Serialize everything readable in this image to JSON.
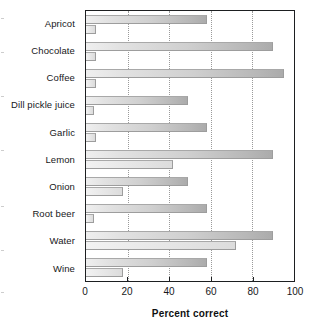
{
  "chart_data": {
    "type": "bar",
    "orientation": "horizontal",
    "title": "",
    "xlabel": "Percent correct",
    "ylabel": "",
    "xlim": [
      0,
      100
    ],
    "xticks": [
      0,
      20,
      40,
      60,
      80,
      100
    ],
    "xtick_labels": [
      "0",
      "20",
      "40",
      "60",
      "80",
      "100"
    ],
    "gridlines": {
      "vertical": [
        20,
        40,
        60,
        80
      ],
      "style": "dotted",
      "horizontal": []
    },
    "legend": {
      "visible": false,
      "entries": []
    },
    "categories": [
      "Apricot",
      "Chocolate",
      "Coffee",
      "Dill pickle juice",
      "Garlic",
      "Lemon",
      "Onion",
      "Root beer",
      "Water",
      "Wine"
    ],
    "series": [
      {
        "name": "upper bar",
        "values": [
          58,
          90,
          95,
          49,
          58,
          90,
          49,
          58,
          90,
          58
        ]
      },
      {
        "name": "lower bar",
        "values": [
          5,
          5,
          5,
          4,
          5,
          42,
          18,
          4,
          72,
          18
        ]
      }
    ]
  },
  "axis": {
    "x_title": "Percent correct"
  }
}
